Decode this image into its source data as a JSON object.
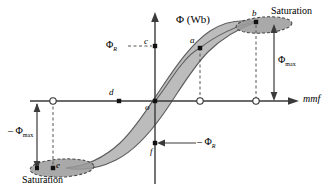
{
  "figure": {
    "type": "magnetic-hysteresis-loop",
    "axes": {
      "y_label": "Φ (Wb)",
      "x_label": "mmf",
      "origin_label": "o",
      "x_axis_y": 101,
      "y_axis_x": 155
    },
    "labels": {
      "phi_r_positive": "Φ",
      "phi_r_positive_sub": "R",
      "phi_r_negative": "– Φ",
      "phi_r_negative_sub": "R",
      "phi_max_positive": "Φ",
      "phi_max_positive_sub": "max",
      "phi_max_negative": "– Φ",
      "phi_max_negative_sub": "max",
      "saturation_top": "Saturation",
      "saturation_bottom": "Saturation"
    },
    "points": [
      {
        "id": "a",
        "label": "a",
        "x": 200,
        "y": 48,
        "style": "filled",
        "label_dx": -9,
        "label_dy": -4
      },
      {
        "id": "b",
        "label": "b",
        "x": 256,
        "y": 22,
        "style": "filled",
        "label_dx": -2,
        "label_dy": -5
      },
      {
        "id": "c",
        "label": "c",
        "x": 155,
        "y": 46,
        "style": "filled",
        "label_dx": -9,
        "label_dy": -3
      },
      {
        "id": "d",
        "label": "d",
        "x": 119,
        "y": 101,
        "style": "filled",
        "label_dx": -8,
        "label_dy": -4
      },
      {
        "id": "e",
        "label": "e",
        "x": 53,
        "y": 168,
        "style": "filled",
        "label_dx": 3,
        "label_dy": -1
      },
      {
        "id": "f",
        "label": "f",
        "x": 155,
        "y": 143,
        "style": "filled",
        "label_dx": -4,
        "label_dy": 11
      },
      {
        "id": "o",
        "label": "o",
        "x": 155,
        "y": 101,
        "style": "filled",
        "label_dx": -2,
        "label_dy": 10
      }
    ],
    "open_markers": [
      {
        "x": 53,
        "y": 101
      },
      {
        "x": 200,
        "y": 101
      },
      {
        "x": 256,
        "y": 101
      }
    ],
    "colors": {
      "line": "#3a3a3a",
      "loop_fill": "#b8b8b8",
      "ellipse_fill": "#9a9a9a",
      "text": "#111111",
      "background": "#ffffff"
    }
  }
}
